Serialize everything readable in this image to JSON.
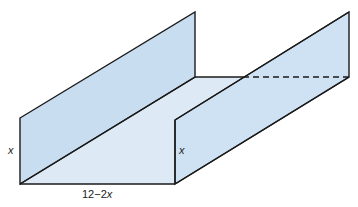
{
  "caption_fragment": "...p ... ... ...g...",
  "diagram": {
    "type": "open-top rectangular gutter (U-channel) in 3D",
    "fill_colors": {
      "wall": "#cfe2f3",
      "floor": "#ddeaf6",
      "outline": "#1a1a1a"
    },
    "labels": {
      "left_height": "x",
      "right_height": "x",
      "base_width_prefix": "12−2",
      "base_width_var": "x"
    }
  }
}
